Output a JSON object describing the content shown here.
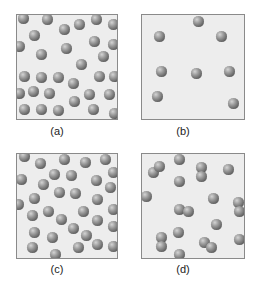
{
  "figure": {
    "panels": [
      {
        "id": "a",
        "label": "(a)",
        "box": {
          "x": 16,
          "y": 14,
          "w": 102,
          "h": 106
        },
        "label_pos": {
          "x": 47,
          "y": 125
        },
        "spheres": [
          [
            22,
            17
          ],
          [
            46,
            18
          ],
          [
            63,
            28
          ],
          [
            78,
            23
          ],
          [
            95,
            18
          ],
          [
            112,
            23
          ],
          [
            33,
            34
          ],
          [
            93,
            40
          ],
          [
            112,
            43
          ],
          [
            18,
            45
          ],
          [
            65,
            47
          ],
          [
            40,
            53
          ],
          [
            102,
            55
          ],
          [
            80,
            63
          ],
          [
            23,
            75
          ],
          [
            40,
            76
          ],
          [
            57,
            76
          ],
          [
            72,
            82
          ],
          [
            98,
            75
          ],
          [
            113,
            75
          ],
          [
            18,
            92
          ],
          [
            32,
            90
          ],
          [
            48,
            92
          ],
          [
            88,
            93
          ],
          [
            108,
            93
          ],
          [
            73,
            100
          ],
          [
            23,
            108
          ],
          [
            40,
            108
          ],
          [
            57,
            109
          ],
          [
            92,
            108
          ],
          [
            113,
            112
          ]
        ]
      },
      {
        "id": "b",
        "label": "(b)",
        "box": {
          "x": 141,
          "y": 14,
          "w": 104,
          "h": 106
        },
        "label_pos": {
          "x": 173,
          "y": 125
        },
        "spheres": [
          [
            197,
            20
          ],
          [
            158,
            35
          ],
          [
            220,
            35
          ],
          [
            160,
            70
          ],
          [
            195,
            72
          ],
          [
            228,
            70
          ],
          [
            156,
            95
          ],
          [
            232,
            102
          ]
        ]
      },
      {
        "id": "c",
        "label": "(c)",
        "box": {
          "x": 16,
          "y": 153,
          "w": 102,
          "h": 106
        },
        "label_pos": {
          "x": 47,
          "y": 263
        },
        "spheres": [
          [
            23,
            155
          ],
          [
            39,
            162
          ],
          [
            63,
            158
          ],
          [
            84,
            161
          ],
          [
            104,
            158
          ],
          [
            112,
            171
          ],
          [
            20,
            178
          ],
          [
            53,
            173
          ],
          [
            70,
            174
          ],
          [
            95,
            179
          ],
          [
            42,
            183
          ],
          [
            58,
            191
          ],
          [
            74,
            192
          ],
          [
            109,
            186
          ],
          [
            17,
            203
          ],
          [
            33,
            197
          ],
          [
            96,
            198
          ],
          [
            31,
            214
          ],
          [
            47,
            210
          ],
          [
            82,
            210
          ],
          [
            112,
            208
          ],
          [
            60,
            218
          ],
          [
            96,
            219
          ],
          [
            33,
            231
          ],
          [
            72,
            227
          ],
          [
            112,
            225
          ],
          [
            51,
            236
          ],
          [
            85,
            234
          ],
          [
            31,
            246
          ],
          [
            77,
            246
          ],
          [
            96,
            243
          ],
          [
            112,
            245
          ],
          [
            54,
            253
          ]
        ]
      },
      {
        "id": "d",
        "label": "(d)",
        "box": {
          "x": 141,
          "y": 153,
          "w": 104,
          "h": 106
        },
        "label_pos": {
          "x": 173,
          "y": 263
        },
        "spheres": [
          [
            152,
            171
          ],
          [
            158,
            165
          ],
          [
            178,
            158
          ],
          [
            200,
            166
          ],
          [
            200,
            175
          ],
          [
            227,
            168
          ],
          [
            178,
            180
          ],
          [
            145,
            195
          ],
          [
            212,
            197
          ],
          [
            237,
            201
          ],
          [
            238,
            210
          ],
          [
            178,
            208
          ],
          [
            187,
            210
          ],
          [
            215,
            223
          ],
          [
            177,
            231
          ],
          [
            160,
            236
          ],
          [
            160,
            245
          ],
          [
            203,
            241
          ],
          [
            210,
            246
          ],
          [
            238,
            238
          ],
          [
            178,
            253
          ]
        ]
      }
    ]
  }
}
